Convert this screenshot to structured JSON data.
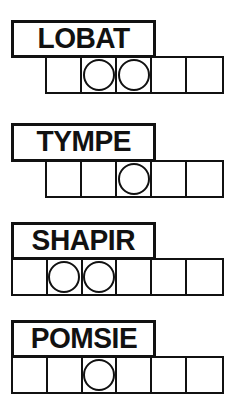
{
  "sheet": {
    "title": "Word puzzle answer grids",
    "ink_color": "#111111",
    "paper_color": "#ffffff",
    "width": 233,
    "height": 395
  },
  "puzzles": [
    {
      "label": "LOBAT",
      "label_box": {
        "x": 11,
        "y": 20,
        "width": 145,
        "height": 38
      },
      "grid": {
        "x": 45,
        "y": 56,
        "width": 179,
        "height": 38,
        "cells": 5
      },
      "circled_cells": [
        2,
        3
      ],
      "cell_marks": [
        "",
        "circle",
        "circle",
        "",
        ""
      ]
    },
    {
      "label": "TYMPE",
      "label_box": {
        "x": 11,
        "y": 123,
        "width": 145,
        "height": 39
      },
      "grid": {
        "x": 45,
        "y": 160,
        "width": 179,
        "height": 38,
        "cells": 5
      },
      "circled_cells": [
        3
      ],
      "cell_marks": [
        "",
        "",
        "circle",
        "",
        ""
      ]
    },
    {
      "label": "SHAPIR",
      "label_box": {
        "x": 11,
        "y": 222,
        "width": 145,
        "height": 38
      },
      "grid": {
        "x": 11,
        "y": 258,
        "width": 213,
        "height": 38,
        "cells": 6
      },
      "circled_cells": [
        2,
        3
      ],
      "cell_marks": [
        "",
        "circle",
        "circle",
        "",
        "",
        ""
      ]
    },
    {
      "label": "POMSIE",
      "label_box": {
        "x": 11,
        "y": 320,
        "width": 145,
        "height": 38
      },
      "grid": {
        "x": 11,
        "y": 356,
        "width": 213,
        "height": 38,
        "cells": 6
      },
      "circled_cells": [
        3
      ],
      "cell_marks": [
        "",
        "",
        "circle",
        "",
        "",
        ""
      ]
    }
  ]
}
